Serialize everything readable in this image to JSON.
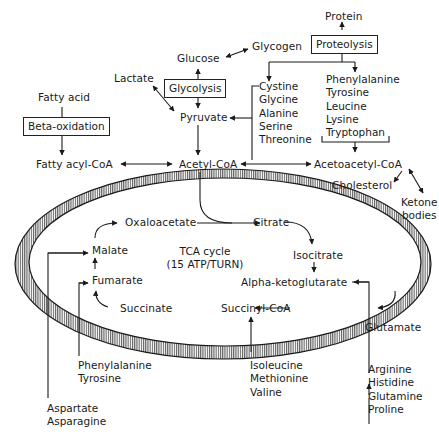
{
  "colors": {
    "ink": "#1a1a1a",
    "background": "#ffffff"
  },
  "top": {
    "protein": "Protein",
    "proteolysis": "Proteolysis",
    "glucose": "Glucose",
    "glycogen": "Glycogen",
    "glycolysis": "Glycolysis",
    "lactate": "Lactate",
    "pyruvate": "Pyruvate",
    "fatty_acid": "Fatty acid",
    "beta_oxidation": "Beta-oxidation",
    "fatty_acyl_coa": "Fatty acyl-CoA",
    "acetyl_coa": "Acetyl-CoA",
    "acetoacetyl_coa": "Acetoacetyl-CoA",
    "cholesterol": "Cholesterol",
    "ketone_bodies": [
      "Ketone",
      "bodies"
    ]
  },
  "amino_acids_to_pyruvate": [
    "Cystine",
    "Glycine",
    "Alanine",
    "Serine",
    "Threonine"
  ],
  "amino_acids_to_acetoacetyl": [
    "Phenylalanine",
    "Tyrosine",
    "Leucine",
    "Lysine",
    "Tryptophan"
  ],
  "cycle": {
    "label": "TCA cycle",
    "yield": "(15 ATP/TURN)",
    "oxaloacetate": "Oxaloacetate",
    "citrate": "Citrate",
    "isocitrate": "Isocitrate",
    "alpha_ketoglutarate": "Alpha-ketoglutarate",
    "succinyl_coa": "Succinyl-CoA",
    "succinate": "Succinate",
    "fumarate": "Fumarate",
    "malate": "Malate"
  },
  "bottom": {
    "glutamate": "Glutamate",
    "to_glutamate": [
      "Arginine",
      "Histidine",
      "Glutamine",
      "Proline"
    ],
    "to_succinyl_coa": [
      "Isoleucine",
      "Methionine",
      "Valine"
    ],
    "to_fumarate": [
      "Phenylalanine",
      "Tyrosine"
    ],
    "to_malate": [
      "Aspartate",
      "Asparagine"
    ]
  }
}
